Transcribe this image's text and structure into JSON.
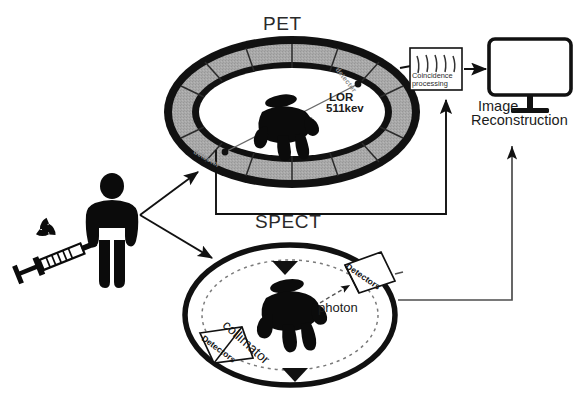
{
  "diagram": {
    "title_pet": "PET",
    "title_spect": "SPECT"
  },
  "pet": {
    "ring_label_top_right": "detector",
    "ring_label_bottom_left": "detector",
    "lor_line1": "LOR",
    "lor_line2": "511kev",
    "patient_icon": "person-icon"
  },
  "spect": {
    "detector_upper_label": "Detectors",
    "detector_lower_label": "Detectors",
    "collimator_label": "collimator",
    "photon_label": "photon",
    "patient_icon": "person-icon"
  },
  "processing": {
    "box_line1": "Coincidence",
    "box_line2": "processing",
    "waves_icon": "signal-waves-icon"
  },
  "output": {
    "monitor_icon": "monitor-icon",
    "label_line1": "Image",
    "label_line2": "Reconstruction"
  },
  "source": {
    "radiation_icon": "radiation-trefoil-icon",
    "syringe_icon": "syringe-icon",
    "patient_icon": "standing-person-icon"
  },
  "colors": {
    "ink": "#111111",
    "ring_fill": "#a9a9a9",
    "ring_outline": "#111111",
    "faint_text": "#8c8c8c",
    "background": "#ffffff"
  }
}
